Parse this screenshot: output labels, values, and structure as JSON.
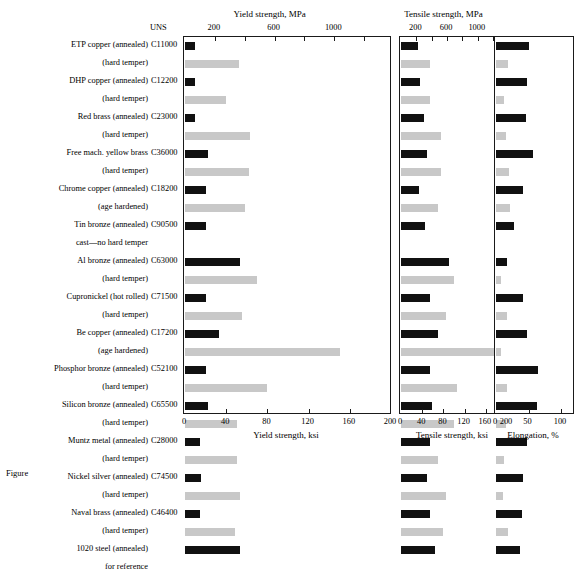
{
  "figure": {
    "caption": "Figure",
    "uns_header": "UNS"
  },
  "rows": [
    {
      "alloy": "ETP copper (annealed)",
      "uns": "C11000",
      "temper": "annealed"
    },
    {
      "alloy": "(hard temper)",
      "uns": "",
      "temper": "hard"
    },
    {
      "alloy": "DHP copper (annealed)",
      "uns": "C12200",
      "temper": "annealed"
    },
    {
      "alloy": "(hard temper)",
      "uns": "",
      "temper": "hard"
    },
    {
      "alloy": "Red brass (annealed)",
      "uns": "C23000",
      "temper": "annealed"
    },
    {
      "alloy": "(hard temper)",
      "uns": "",
      "temper": "hard"
    },
    {
      "alloy": "Free mach. yellow brass",
      "uns": "C36000",
      "temper": "annealed"
    },
    {
      "alloy": "(hard temper)",
      "uns": "",
      "temper": "hard"
    },
    {
      "alloy": "Chrome copper (annealed)",
      "uns": "C18200",
      "temper": "annealed"
    },
    {
      "alloy": "(age hardened)",
      "uns": "",
      "temper": "hard"
    },
    {
      "alloy": "Tin bronze (annealed)",
      "uns": "C90500",
      "temper": "annealed"
    },
    {
      "alloy": "cast—no hard temper",
      "uns": "",
      "temper": "none"
    },
    {
      "alloy": "Al bronze (annealed)",
      "uns": "C63000",
      "temper": "annealed"
    },
    {
      "alloy": "(hard temper)",
      "uns": "",
      "temper": "hard"
    },
    {
      "alloy": "Cupronickel (hot rolled)",
      "uns": "C71500",
      "temper": "annealed"
    },
    {
      "alloy": "(hard temper)",
      "uns": "",
      "temper": "hard"
    },
    {
      "alloy": "Be copper (annealed)",
      "uns": "C17200",
      "temper": "annealed"
    },
    {
      "alloy": "(age hardened)",
      "uns": "",
      "temper": "hard"
    },
    {
      "alloy": "Phosphor bronze (annealed)",
      "uns": "C52100",
      "temper": "annealed"
    },
    {
      "alloy": "(hard temper)",
      "uns": "",
      "temper": "hard"
    },
    {
      "alloy": "Silicon bronze (annealed)",
      "uns": "C65500",
      "temper": "annealed"
    },
    {
      "alloy": "(hard temper)",
      "uns": "",
      "temper": "hard"
    },
    {
      "alloy": "Muntz metal (annealed)",
      "uns": "C28000",
      "temper": "annealed"
    },
    {
      "alloy": "(hard temper)",
      "uns": "",
      "temper": "hard"
    },
    {
      "alloy": "Nickel silver (annealed)",
      "uns": "C74500",
      "temper": "annealed"
    },
    {
      "alloy": "(hard temper)",
      "uns": "",
      "temper": "hard"
    },
    {
      "alloy": "Naval brass (annealed)",
      "uns": "C46400",
      "temper": "annealed"
    },
    {
      "alloy": "(hard temper)",
      "uns": "",
      "temper": "hard"
    },
    {
      "alloy": "1020 steel (annealed)",
      "uns": "",
      "temper": "annealed"
    },
    {
      "alloy": "for reference",
      "uns": "",
      "temper": "none"
    }
  ],
  "colors": {
    "soft_bar": "#111111",
    "hard_bar": "#c8c8c8",
    "axis": "#1a1a1a"
  },
  "chart_data": [
    {
      "type": "bar",
      "title": "Yield strength, MPa",
      "xlabel": "Yield strength, ksi",
      "ylabel": "",
      "orientation": "horizontal",
      "grid": false,
      "legend": "none",
      "xlim_ksi": [
        0,
        200
      ],
      "xticks_ksi": [
        0,
        40,
        80,
        120,
        160,
        200
      ],
      "xticklabels_ksi": [
        "0",
        "40",
        "80",
        "120",
        "160",
        "200"
      ],
      "xlim_mpa": [
        0,
        1380
      ],
      "xticks_mpa": [
        200,
        600,
        1000
      ],
      "xticklabels_mpa": [
        "200",
        "600",
        "1000"
      ],
      "categories": [
        "ETP copper (annealed)",
        "(hard temper)",
        "DHP copper (annealed)",
        "(hard temper)",
        "Red brass (annealed)",
        "(hard temper)",
        "Free mach. yellow brass",
        "(hard temper)",
        "Chrome copper (annealed)",
        "(age hardened)",
        "Tin bronze (annealed)",
        "cast—no hard temper",
        "Al bronze (annealed)",
        "(hard temper)",
        "Cupronickel (hot rolled)",
        "(hard temper)",
        "Be copper (annealed)",
        "(age hardened)",
        "Phosphor bronze (annealed)",
        "(hard temper)",
        "Silicon bronze (annealed)",
        "(hard temper)",
        "Muntz metal (annealed)",
        "(hard temper)",
        "Nickel silver (annealed)",
        "(hard temper)",
        "Naval brass (annealed)",
        "(hard temper)",
        "1020 steel (annealed)",
        "for reference"
      ],
      "values_ksi": [
        10,
        52,
        10,
        40,
        10,
        63,
        22,
        62,
        20,
        58,
        20,
        0,
        53,
        70,
        20,
        55,
        33,
        150,
        20,
        80,
        22,
        50,
        15,
        50,
        16,
        53,
        15,
        49,
        53,
        0
      ],
      "units": "ksi"
    },
    {
      "type": "bar",
      "title": "Tensile strength, MPa",
      "xlabel": "Tensile strength, ksi",
      "ylabel": "",
      "orientation": "horizontal",
      "grid": false,
      "legend": "none",
      "xlim_ksi": [
        0,
        200
      ],
      "xticks_ksi": [
        0,
        40,
        80,
        120,
        160,
        200
      ],
      "xticklabels_ksi": [
        "0",
        "40",
        "80",
        "120",
        "160",
        "200"
      ],
      "xlim_mpa": [
        0,
        1380
      ],
      "xticks_mpa": [
        200,
        600,
        1000
      ],
      "xticklabels_mpa": [
        "200",
        "600",
        "1000"
      ],
      "categories": [
        "ETP copper (annealed)",
        "(hard temper)",
        "DHP copper (annealed)",
        "(hard temper)",
        "Red brass (annealed)",
        "(hard temper)",
        "Free mach. yellow brass",
        "(hard temper)",
        "Chrome copper (annealed)",
        "(age hardened)",
        "Tin bronze (annealed)",
        "cast—no hard temper",
        "Al bronze (annealed)",
        "(hard temper)",
        "Cupronickel (hot rolled)",
        "(hard temper)",
        "Be copper (annealed)",
        "(age hardened)",
        "Phosphor bronze (annealed)",
        "(hard temper)",
        "Silicon bronze (annealed)",
        "(hard temper)",
        "Muntz metal (annealed)",
        "(hard temper)",
        "Nickel silver (annealed)",
        "(hard temper)",
        "Naval brass (annealed)",
        "(hard temper)",
        "1020 steel (annealed)",
        "for reference"
      ],
      "values_ksi": [
        32,
        55,
        35,
        55,
        44,
        75,
        49,
        75,
        34,
        70,
        45,
        0,
        90,
        100,
        55,
        85,
        70,
        190,
        55,
        105,
        58,
        100,
        54,
        70,
        49,
        85,
        55,
        80,
        65,
        0
      ],
      "units": "ksi"
    },
    {
      "type": "bar",
      "title": "",
      "xlabel": "Elongation, %",
      "ylabel": "",
      "orientation": "horizontal",
      "grid": false,
      "legend": "none",
      "xlim": [
        0,
        120
      ],
      "xticks": [
        0,
        50,
        100
      ],
      "xticklabels": [
        "0",
        "50",
        "100"
      ],
      "categories": [
        "ETP copper (annealed)",
        "(hard temper)",
        "DHP copper (annealed)",
        "(hard temper)",
        "Red brass (annealed)",
        "(hard temper)",
        "Free mach. yellow brass",
        "(hard temper)",
        "Chrome copper (annealed)",
        "(age hardened)",
        "Tin bronze (annealed)",
        "cast—no hard temper",
        "Al bronze (annealed)",
        "(hard temper)",
        "Cupronickel (hot rolled)",
        "(hard temper)",
        "Be copper (annealed)",
        "(age hardened)",
        "Phosphor bronze (annealed)",
        "(hard temper)",
        "Silicon bronze (annealed)",
        "(hard temper)",
        "Muntz metal (annealed)",
        "(hard temper)",
        "Nickel silver (annealed)",
        "(hard temper)",
        "Naval brass (annealed)",
        "(hard temper)",
        "1020 steel (annealed)",
        "for reference"
      ],
      "values": [
        50,
        18,
        48,
        13,
        46,
        15,
        57,
        20,
        42,
        21,
        28,
        0,
        17,
        8,
        42,
        17,
        48,
        7,
        65,
        17,
        63,
        15,
        48,
        13,
        41,
        10,
        40,
        19,
        37,
        0
      ],
      "units": "%"
    }
  ]
}
